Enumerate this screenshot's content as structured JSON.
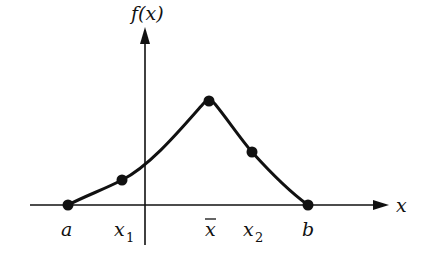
{
  "diagram": {
    "type": "function-plot",
    "y_axis_label": "f(x)",
    "x_axis_label": "x",
    "colors": {
      "ink": "#111111",
      "background": "#ffffff"
    },
    "points": [
      {
        "id": "a",
        "label": "a",
        "sub": "",
        "x": 68,
        "y": 205
      },
      {
        "id": "x1",
        "label": "x",
        "sub": "1",
        "x": 122,
        "y": 180
      },
      {
        "id": "xbar",
        "label": "x",
        "sub": "",
        "bar": true,
        "x": 209,
        "y": 101
      },
      {
        "id": "x2",
        "label": "x",
        "sub": "2",
        "x": 252,
        "y": 152
      },
      {
        "id": "b",
        "label": "b",
        "sub": "",
        "x": 308,
        "y": 205
      }
    ],
    "labels": {
      "a": "a",
      "x1_main": "x",
      "x1_sub": "1",
      "xbar_main": "x",
      "x2_main": "x",
      "x2_sub": "2",
      "b": "b",
      "fx": "f(x)",
      "x": "x"
    }
  }
}
